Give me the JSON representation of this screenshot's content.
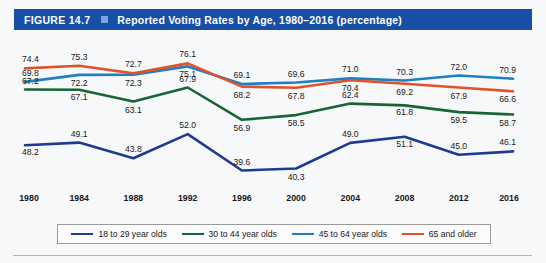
{
  "header": {
    "figure_number": "FIGURE 14.7",
    "separator_icon": "square-bullet-icon",
    "title": "Reported Voting Rates by Age, 1980–2016 (percentage)",
    "bar_color": "#174ea6",
    "bullet_color": "#7ea6de"
  },
  "chart_data": {
    "type": "line",
    "title": "Reported Voting Rates by Age, 1980–2016 (percentage)",
    "xlabel": "",
    "ylabel": "",
    "ylim": [
      35,
      80
    ],
    "grid": false,
    "legend_position": "bottom",
    "categories": [
      "1980",
      "1984",
      "1988",
      "1992",
      "1996",
      "2000",
      "2004",
      "2008",
      "2012",
      "2016"
    ],
    "series": [
      {
        "name": "18 to 29 year olds",
        "color": "#1f3a93",
        "values": [
          48.2,
          49.1,
          43.8,
          52.0,
          39.6,
          40.3,
          49.0,
          51.1,
          45.0,
          46.1
        ]
      },
      {
        "name": "30 to 44 year olds",
        "color": "#166534",
        "values": [
          67.2,
          67.1,
          63.1,
          67.9,
          56.9,
          58.5,
          62.4,
          61.8,
          59.5,
          58.7
        ]
      },
      {
        "name": "45 to 64 year olds",
        "color": "#1f7fc4",
        "values": [
          69.8,
          72.2,
          72.3,
          75.1,
          69.1,
          69.6,
          71.0,
          70.3,
          72.0,
          70.9
        ]
      },
      {
        "name": "65 and older",
        "color": "#e0532a",
        "values": [
          74.4,
          75.3,
          72.7,
          76.1,
          68.2,
          67.8,
          70.4,
          69.2,
          67.9,
          66.6
        ]
      }
    ]
  },
  "legend": {
    "entries": [
      {
        "label": "18 to 29 year olds",
        "color": "#1f3a93"
      },
      {
        "label": "30 to 44 year olds",
        "color": "#166534"
      },
      {
        "label": "45 to 64 year olds",
        "color": "#1f7fc4"
      },
      {
        "label": "65 and older",
        "color": "#e0532a"
      }
    ]
  }
}
